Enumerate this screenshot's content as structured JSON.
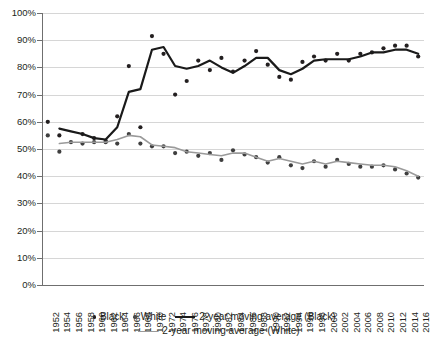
{
  "chart_data": {
    "type": "line",
    "title": "",
    "xlabel": "",
    "ylabel": "",
    "ylim": [
      0,
      100
    ],
    "grid": true,
    "legend_position": "bottom",
    "x": [
      1952,
      1954,
      1956,
      1958,
      1960,
      1962,
      1964,
      1966,
      1968,
      1970,
      1972,
      1974,
      1976,
      1978,
      1980,
      1982,
      1984,
      1986,
      1988,
      1990,
      1992,
      1994,
      1996,
      1998,
      2000,
      2002,
      2004,
      2006,
      2008,
      2010,
      2012,
      2014,
      2016
    ],
    "y_tick_labels": [
      "0%",
      "10%",
      "20%",
      "30%",
      "40%",
      "50%",
      "60%",
      "70%",
      "80%",
      "90%",
      "100%"
    ],
    "y_ticks": [
      0,
      10,
      20,
      30,
      40,
      50,
      60,
      70,
      80,
      90,
      100
    ],
    "x_tick_labels": [
      "1952",
      "1954",
      "1956",
      "1958",
      "1960",
      "1962",
      "1964",
      "1966",
      "1968",
      "1970",
      "1972",
      "1974",
      "1976",
      "1978",
      "1980",
      "1982",
      "1984",
      "1986",
      "1988",
      "1990",
      "1992",
      "1994",
      "1996",
      "1998",
      "2000",
      "2002",
      "2004",
      "2006",
      "2008",
      "2010",
      "2012",
      "2014",
      "2016"
    ],
    "series": [
      {
        "name": "Black",
        "kind": "scatter",
        "color": "#231f20",
        "values": [
          60,
          55,
          null,
          55.5,
          54,
          53,
          62,
          80.5,
          58,
          91.5,
          85,
          70,
          75,
          82.5,
          79,
          83.5,
          78.5,
          82.5,
          86,
          81,
          76.5,
          75.5,
          82,
          84,
          82.5,
          85,
          82.5,
          85,
          85.5,
          87,
          88,
          88,
          84
        ]
      },
      {
        "name": "White",
        "kind": "scatter",
        "color": "#3f3f3f",
        "values": [
          55,
          49,
          52.5,
          52,
          52.5,
          52.5,
          52,
          55.5,
          52,
          51,
          51,
          48.5,
          49,
          47.5,
          48.5,
          46,
          49.5,
          48,
          47,
          45,
          47,
          44,
          43,
          45.5,
          43.5,
          46,
          44.5,
          43.5,
          43.5,
          44,
          42.5,
          41,
          39.5
        ]
      },
      {
        "name": "2-year moving average (Black)",
        "kind": "line",
        "color": "#1a1a1a",
        "width": 2.2,
        "values": [
          null,
          57.5,
          56.5,
          55.5,
          54,
          53.5,
          58,
          71,
          72,
          86.5,
          87.5,
          80.5,
          79.5,
          80.5,
          82.5,
          80,
          78,
          80.5,
          83.5,
          83.5,
          79,
          77.5,
          79.5,
          82.5,
          83,
          83,
          83,
          84,
          85.5,
          85.5,
          86.5,
          86.5,
          85
        ]
      },
      {
        "name": "2-year moving average (White)",
        "kind": "line",
        "color": "#9a9a9a",
        "width": 1.6,
        "values": [
          null,
          52,
          52.5,
          52.5,
          52.5,
          52.5,
          53.5,
          55,
          54.5,
          51.5,
          51,
          50.5,
          49,
          48.5,
          48,
          47.5,
          48.5,
          48.5,
          47,
          45.5,
          46.5,
          45.5,
          44.5,
          45.5,
          44.5,
          45.5,
          45,
          44.5,
          44,
          44,
          43.5,
          42,
          40
        ]
      }
    ]
  },
  "legend": {
    "items": [
      {
        "label": "Black",
        "marker": "dot",
        "color": "#231f20"
      },
      {
        "label": "White",
        "marker": "dot",
        "color": "#4a4a4a"
      },
      {
        "label": "2-year moving average (Black)",
        "marker": "line",
        "color": "#1a1a1a"
      },
      {
        "label": "2-year moving average (White)",
        "marker": "line",
        "color": "#9a9a9a"
      }
    ]
  }
}
